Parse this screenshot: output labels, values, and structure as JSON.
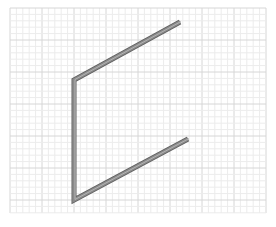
{
  "viewport": {
    "background": "#ffffff",
    "grid": {
      "x0": 10,
      "y0": 8,
      "x1": 266,
      "y1": 213,
      "minor_step": 6.4,
      "major_every": 5,
      "minor_color": "#ececec",
      "major_color": "#d6d6d6"
    },
    "beam": {
      "color_face": "#8a8a8a",
      "color_dark": "#5e5e5e",
      "color_light": "#b4b4b4",
      "points": [
        [
          180,
          22
        ],
        [
          74,
          80
        ],
        [
          74,
          200
        ],
        [
          188,
          139
        ]
      ]
    }
  }
}
